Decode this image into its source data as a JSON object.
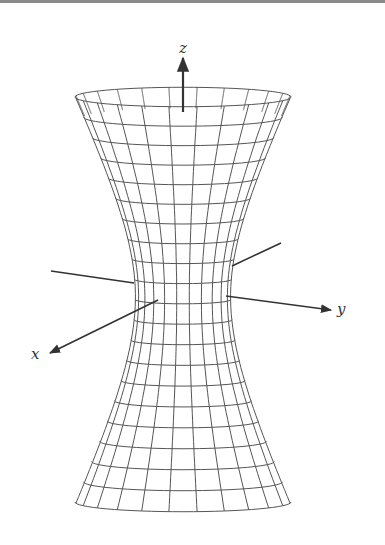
{
  "figure": {
    "colors": {
      "mesh": "#555555",
      "axis": "#333333",
      "top_rule": "#8a8a8a",
      "background": "#ffffff"
    },
    "surface": {
      "center_x": 183,
      "waist_y": 296,
      "waist_radius": 48,
      "top_y": 97,
      "bottom_y": 502,
      "end_radius": 108,
      "ellipse_ratio": 0.09,
      "rings": 20,
      "meridians": 24
    },
    "axes": {
      "z": {
        "label": "z",
        "label_x": 179,
        "label_y": 41,
        "from": [
          183,
          112
        ],
        "to": [
          183,
          58
        ]
      },
      "y_pos": {
        "label": "y",
        "label_x": 337,
        "label_y": 302,
        "from": [
          226,
          296
        ],
        "to": [
          331,
          310
        ]
      },
      "y_neg": {
        "from": [
          51,
          271
        ],
        "to": [
          134,
          283
        ]
      },
      "x_pos": {
        "label": "x",
        "label_x": 31,
        "label_y": 347,
        "from": [
          158,
          300
        ],
        "to": [
          50,
          353
        ]
      },
      "x_neg": {
        "from": [
          232,
          266
        ],
        "to": [
          281,
          243
        ]
      }
    }
  }
}
